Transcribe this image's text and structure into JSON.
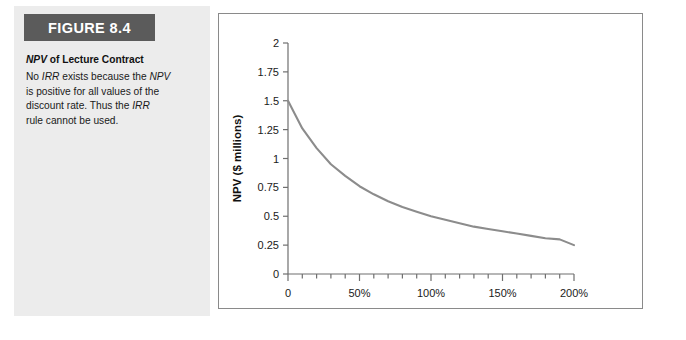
{
  "figure": {
    "badge_label": "FIGURE 8.4",
    "caption_title_part1": "NPV",
    "caption_title_part2": " of Lecture Contract",
    "caption_lines": [
      {
        "segments": [
          {
            "t": "No ",
            "i": false
          },
          {
            "t": "IRR",
            "i": true
          },
          {
            "t": " exists because the ",
            "i": false
          },
          {
            "t": "NPV",
            "i": true
          }
        ]
      },
      {
        "segments": [
          {
            "t": "is positive for all values of the",
            "i": false
          }
        ]
      },
      {
        "segments": [
          {
            "t": "discount rate. Thus the ",
            "i": false
          },
          {
            "t": "IRR",
            "i": true
          }
        ]
      },
      {
        "segments": [
          {
            "t": "rule cannot be used.",
            "i": false
          }
        ]
      }
    ]
  },
  "colors": {
    "badge_background": "#5b5b5b",
    "badge_text": "#ffffff",
    "panel_background": "#ececec",
    "chart_border": "#8a8a8a",
    "curve": "#8c8c8c",
    "axis": "#6f6f6f",
    "text": "#1a1a1a"
  },
  "chart_data": {
    "type": "line",
    "title": "",
    "xlabel": "Discount Rate",
    "ylabel": "NPV ($ millions)",
    "xlim": [
      0,
      200
    ],
    "ylim": [
      0,
      2
    ],
    "grid": false,
    "legend": "none",
    "x_tick_labels": [
      "0",
      "50%",
      "100%",
      "150%",
      "200%"
    ],
    "x_tick_values": [
      0,
      50,
      100,
      150,
      200
    ],
    "x_minor_step": 10,
    "y_tick_labels": [
      "0",
      "0.25",
      "0.5",
      "0.75",
      "1",
      "1.25",
      "1.5",
      "1.75",
      "2"
    ],
    "y_tick_values": [
      0,
      0.25,
      0.5,
      0.75,
      1,
      1.25,
      1.5,
      1.75,
      2
    ],
    "series": [
      {
        "name": "NPV of Lecture Contract",
        "x": [
          0,
          10,
          20,
          30,
          40,
          50,
          60,
          70,
          80,
          90,
          100,
          110,
          120,
          130,
          140,
          150,
          160,
          170,
          180,
          190,
          200
        ],
        "values": [
          1.5,
          1.26,
          1.09,
          0.95,
          0.85,
          0.76,
          0.69,
          0.63,
          0.58,
          0.54,
          0.5,
          0.47,
          0.44,
          0.41,
          0.39,
          0.37,
          0.35,
          0.33,
          0.31,
          0.3,
          0.25
        ]
      }
    ]
  }
}
